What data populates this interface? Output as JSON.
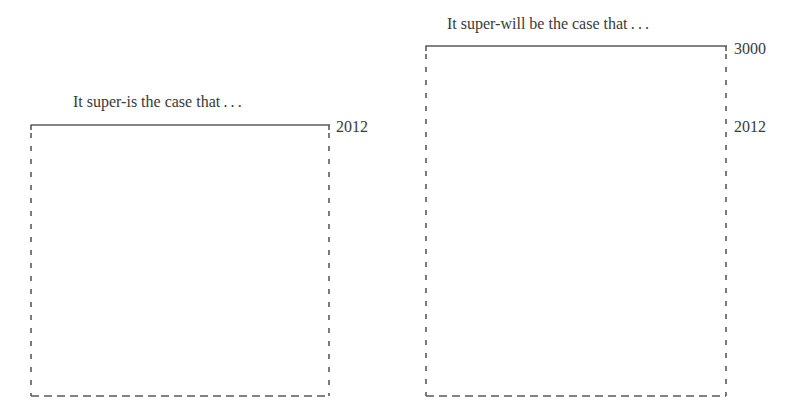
{
  "panels": [
    {
      "title": "It super-is the case that . . .",
      "labels": [
        {
          "text": "2012",
          "position": "top"
        }
      ]
    },
    {
      "title": "It super-will be the case that . . .",
      "labels": [
        {
          "text": "3000",
          "position": "top"
        },
        {
          "text": "2012",
          "position": "middle"
        }
      ]
    }
  ],
  "colors": {
    "line": "#5a5a5a",
    "text": "#3a3a3a"
  }
}
